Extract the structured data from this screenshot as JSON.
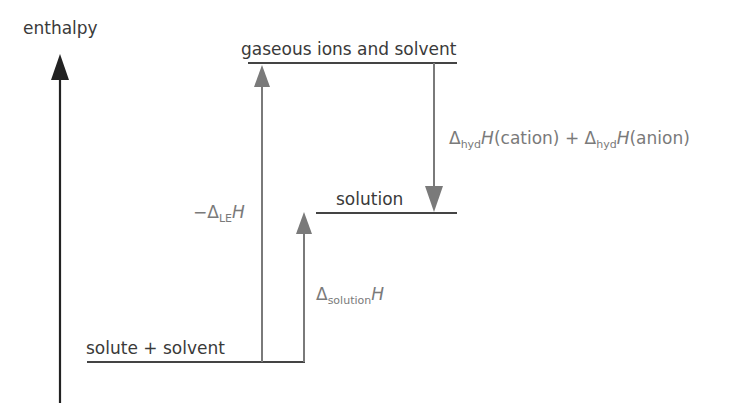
{
  "diagram": {
    "type": "enthalpy level diagram",
    "axis_label": "enthalpy",
    "levels": {
      "top": "gaseous ions and solvent",
      "middle": "solution",
      "bottom": "solute + solvent"
    },
    "arrows": {
      "lattice": {
        "prefix": "−Δ",
        "sub": "LE",
        "symbol": "H"
      },
      "hydration": {
        "delta1": "Δ",
        "sub1": "hyd",
        "symbol1": "H",
        "arg1": "(cation) + ",
        "delta2": "Δ",
        "sub2": "hyd",
        "symbol2": "H",
        "arg2": "(anion)"
      },
      "solution": {
        "delta": "Δ",
        "sub": "solution",
        "symbol": "H"
      }
    },
    "colors": {
      "axis": "#222222",
      "level_line": "#444444",
      "arrow": "#7a7a7a",
      "text_dark": "#3a3a3a",
      "text_gray": "#7a7a7a"
    }
  }
}
